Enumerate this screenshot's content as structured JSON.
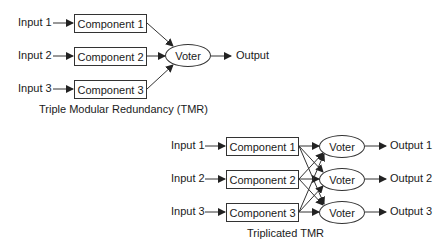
{
  "tmr": {
    "caption": "Triple Modular Redundancy (TMR)",
    "inputs": [
      "Input 1",
      "Input 2",
      "Input 3"
    ],
    "components": [
      "Component 1",
      "Component 2",
      "Component 3"
    ],
    "voter": "Voter",
    "output": "Output"
  },
  "triplicated": {
    "caption": "Triplicated TMR",
    "inputs": [
      "Input 1",
      "Input 2",
      "Input 3"
    ],
    "components": [
      "Component 1",
      "Component 2",
      "Component 3"
    ],
    "voters": [
      "Voter",
      "Voter",
      "Voter"
    ],
    "outputs": [
      "Output 1",
      "Output 2",
      "Output 3"
    ]
  },
  "colors": {
    "stroke": "#333333",
    "text": "#1a1a1a",
    "background": "#ffffff"
  }
}
